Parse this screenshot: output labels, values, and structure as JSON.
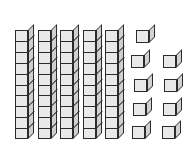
{
  "figure": {
    "kind": "base-ten-blocks",
    "title": "Base-ten blocks showing 59",
    "background_color": "#ffffff",
    "outline_color": "#2b2b2b",
    "front_face_color": "#e9e9e9",
    "top_face_color": "#f4f4f4",
    "side_face_color": "#d0d0d0"
  },
  "chart_data": {
    "type": "bar",
    "title": "Base-ten blocks showing 59",
    "categories": [
      "tens",
      "ones"
    ],
    "values": [
      5,
      9
    ],
    "xlabel": "place value",
    "ylabel": "count",
    "annotations": {
      "tens_value": 50,
      "ones_value": 9,
      "total": 59,
      "cubes_per_rod": 10
    }
  },
  "tens": {
    "label": "tens rods",
    "count": 5,
    "cubes_per_rod": 10,
    "geometry": {
      "first_left": 15,
      "spacing": 22.5,
      "top": 24,
      "front_width": 13,
      "cell_height": 10.9,
      "depth_x": 6,
      "depth_y": 6
    },
    "rods": [
      {
        "index": 1,
        "cubes": 10
      },
      {
        "index": 2,
        "cubes": 10
      },
      {
        "index": 3,
        "cubes": 10
      },
      {
        "index": 4,
        "cubes": 10
      },
      {
        "index": 5,
        "cubes": 10
      }
    ]
  },
  "ones": {
    "label": "unit cubes",
    "count": 9,
    "geometry": {
      "front_size": 13,
      "depth_x": 6,
      "depth_y": 6
    },
    "cubes": [
      {
        "index": 1,
        "x": 136,
        "y": 24
      },
      {
        "index": 2,
        "x": 131,
        "y": 49
      },
      {
        "index": 3,
        "x": 163,
        "y": 49
      },
      {
        "index": 4,
        "x": 134,
        "y": 73
      },
      {
        "index": 5,
        "x": 164,
        "y": 73
      },
      {
        "index": 6,
        "x": 133,
        "y": 97
      },
      {
        "index": 7,
        "x": 163,
        "y": 97
      },
      {
        "index": 8,
        "x": 132,
        "y": 120
      },
      {
        "index": 9,
        "x": 162,
        "y": 120
      }
    ]
  }
}
